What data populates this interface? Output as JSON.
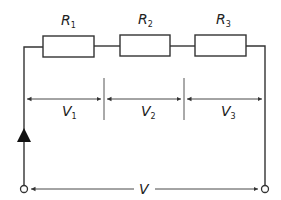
{
  "diagram": {
    "type": "series-circuit",
    "resistors": [
      {
        "symbol": "R",
        "subscript": "1"
      },
      {
        "symbol": "R",
        "subscript": "2"
      },
      {
        "symbol": "R",
        "subscript": "3"
      }
    ],
    "voltage_drops": [
      {
        "symbol": "V",
        "subscript": "1"
      },
      {
        "symbol": "V",
        "subscript": "2"
      },
      {
        "symbol": "V",
        "subscript": "3"
      }
    ],
    "supply_voltage": {
      "symbol": "V"
    },
    "current_arrow_direction": "up",
    "colors": {
      "line": "#333333",
      "background": "#ffffff"
    }
  }
}
